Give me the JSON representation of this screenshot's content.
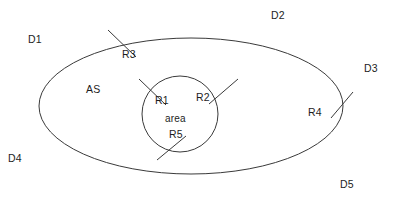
{
  "diagram": {
    "type": "venn-region-diagram",
    "background_color": "#ffffff",
    "stroke_color": "#3a3a3a",
    "text_color": "#1d1d1d",
    "shapes": {
      "outer_ellipse": {
        "name": "AS",
        "center_x": 191,
        "center_y": 106,
        "radius_x": 152,
        "radius_y": 68
      },
      "inner_circle": {
        "name": "area",
        "center_x": 180,
        "center_y": 114,
        "radius": 38
      }
    },
    "labels": {
      "d1": "D1",
      "d2": "D2",
      "d3": "D3",
      "d4": "D4",
      "d5": "D5",
      "as": "AS",
      "area": "area",
      "r1": "R1",
      "r2": "R2",
      "r3": "R3",
      "r4": "R4",
      "r5": "R5"
    }
  }
}
